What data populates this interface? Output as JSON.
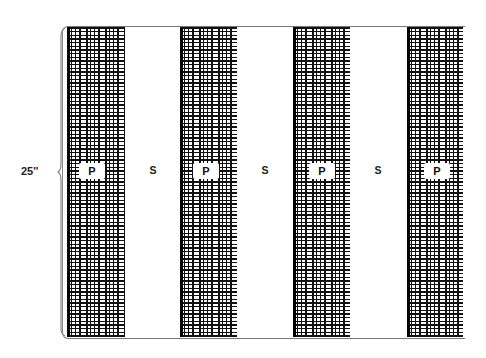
{
  "diagram": {
    "dimension_label": "25''",
    "stripes": [
      {
        "type": "plaid",
        "label": "P"
      },
      {
        "type": "solid",
        "label": "S"
      },
      {
        "type": "plaid",
        "label": "P"
      },
      {
        "type": "solid",
        "label": "S"
      },
      {
        "type": "plaid",
        "label": "P"
      },
      {
        "type": "solid",
        "label": "S"
      },
      {
        "type": "plaid",
        "label": "P"
      }
    ],
    "colors": {
      "plaid_dark": "#111111",
      "background": "#ffffff",
      "border": "#777777"
    }
  }
}
